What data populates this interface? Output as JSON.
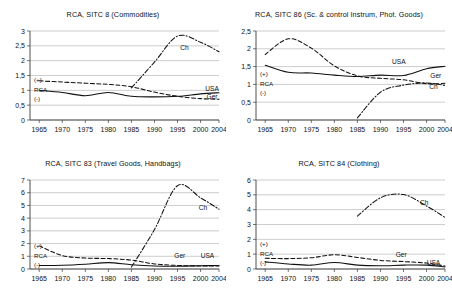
{
  "figure": {
    "panel_count": 4,
    "x_axis": {
      "label": "",
      "ticks": [
        1965,
        1970,
        1975,
        1980,
        1985,
        1990,
        1995,
        2000,
        2004
      ],
      "tick_labels": [
        "1965",
        "1970",
        "1975",
        "1980",
        "1985",
        "1990",
        "1995",
        "2000",
        "2004"
      ],
      "range": [
        1963,
        2004
      ]
    },
    "annotations": {
      "plus": "(+)",
      "rca": "RCA",
      "minus": "(-)"
    },
    "series_names": {
      "usa": "USA",
      "ger": "Ger",
      "ch": "Ch"
    },
    "colors": {
      "line": "#111111",
      "grid": "#9a9a9a",
      "axis": "#3c3c3c",
      "background": "#ffffff"
    }
  },
  "chart_data": [
    {
      "type": "line",
      "title": "RCA, SITC 8 (Commodities)",
      "xlabel": "",
      "ylabel": "",
      "xlim": [
        1963,
        2004
      ],
      "ylim": [
        0,
        3
      ],
      "yticks": [
        0,
        0.5,
        1,
        1.5,
        2,
        2.5,
        3
      ],
      "ytick_labels": [
        "0",
        "0,5",
        "1",
        "1,5",
        "2",
        "2,5",
        "3"
      ],
      "grid": true,
      "legend": "inline-labels",
      "x": [
        1965,
        1970,
        1975,
        1980,
        1985,
        1990,
        1995,
        2000,
        2004
      ],
      "series": [
        {
          "name": "USA",
          "style": "solid",
          "values": [
            1.0,
            0.93,
            0.82,
            0.93,
            0.8,
            0.78,
            0.8,
            0.88,
            0.92
          ],
          "label_xy": [
            2002.5,
            0.97
          ]
        },
        {
          "name": "Ger",
          "style": "dashed",
          "values": [
            1.32,
            1.28,
            1.24,
            1.2,
            1.12,
            0.94,
            0.8,
            0.72,
            0.7
          ],
          "label_xy": [
            2002.5,
            0.7
          ]
        },
        {
          "name": "Ch",
          "style": "dashdot",
          "values": [
            null,
            null,
            null,
            null,
            1.08,
            1.95,
            2.83,
            2.62,
            2.3
          ],
          "label_xy": [
            1996.5,
            2.37
          ]
        }
      ]
    },
    {
      "type": "line",
      "title": "RCA, SITC 86 (Sc. & control Instrum, Phot. Goods)",
      "xlabel": "",
      "ylabel": "",
      "xlim": [
        1963,
        2004
      ],
      "ylim": [
        0,
        2.5
      ],
      "yticks": [
        0,
        0.5,
        1,
        1.5,
        2,
        2.5
      ],
      "ytick_labels": [
        "0",
        "0,5",
        "1",
        "1,5",
        "2",
        "2,5"
      ],
      "grid": true,
      "legend": "inline-labels",
      "x": [
        1965,
        1970,
        1975,
        1980,
        1985,
        1990,
        1995,
        2000,
        2004
      ],
      "series": [
        {
          "name": "USA",
          "style": "solid",
          "values": [
            1.54,
            1.34,
            1.32,
            1.26,
            1.22,
            1.26,
            1.25,
            1.44,
            1.51
          ],
          "label_xy": [
            1994.0,
            1.57
          ]
        },
        {
          "name": "Ger",
          "style": "dashed",
          "values": [
            1.84,
            2.28,
            2.02,
            1.52,
            1.24,
            1.17,
            1.13,
            1.02,
            1.03
          ],
          "label_xy": [
            2002.0,
            1.18
          ]
        },
        {
          "name": "Ch",
          "style": "dashdot",
          "values": [
            null,
            null,
            null,
            null,
            0.06,
            0.78,
            0.98,
            1.04,
            0.97
          ],
          "label_xy": [
            2001.5,
            0.86
          ]
        }
      ]
    },
    {
      "type": "line",
      "title": "RCA, SITC 83 (Travel Goods, Handbags)",
      "xlabel": "",
      "ylabel": "",
      "xlim": [
        1963,
        2004
      ],
      "ylim": [
        0,
        7
      ],
      "yticks": [
        0,
        1,
        2,
        3,
        4,
        5,
        6,
        7
      ],
      "ytick_labels": [
        "0",
        "1",
        "2",
        "3",
        "4",
        "5",
        "6",
        "7"
      ],
      "grid": true,
      "legend": "inline-labels",
      "x": [
        1965,
        1970,
        1975,
        1980,
        1985,
        1990,
        1995,
        2000,
        2004
      ],
      "series": [
        {
          "name": "USA",
          "style": "solid",
          "values": [
            0.28,
            0.3,
            0.38,
            0.5,
            0.34,
            0.24,
            0.22,
            0.26,
            0.28
          ],
          "label_xy": [
            2001.5,
            0.85
          ]
        },
        {
          "name": "Ger",
          "style": "dashed",
          "values": [
            1.82,
            1.06,
            0.86,
            0.82,
            0.7,
            0.4,
            0.28,
            0.24,
            0.24
          ],
          "label_xy": [
            1995.5,
            0.84
          ]
        },
        {
          "name": "Ch",
          "style": "dashdot",
          "values": [
            null,
            null,
            null,
            null,
            0.15,
            3.1,
            6.55,
            5.6,
            4.7
          ],
          "label_xy": [
            2000.5,
            4.68
          ]
        }
      ]
    },
    {
      "type": "line",
      "title": "RCA, SITC 84 (Clothing)",
      "xlabel": "",
      "ylabel": "",
      "xlim": [
        1963,
        2004
      ],
      "ylim": [
        0,
        6
      ],
      "yticks": [
        0,
        1,
        2,
        3,
        4,
        5,
        6
      ],
      "ytick_labels": [
        "0",
        "1",
        "2",
        "3",
        "4",
        "5",
        "6"
      ],
      "grid": true,
      "legend": "inline-labels",
      "x": [
        1965,
        1970,
        1975,
        1980,
        1985,
        1990,
        1995,
        2000,
        2004
      ],
      "series": [
        {
          "name": "USA",
          "style": "solid",
          "values": [
            0.48,
            0.34,
            0.26,
            0.44,
            0.26,
            0.22,
            0.26,
            0.26,
            0.14
          ],
          "label_xy": [
            2001.5,
            0.25
          ]
        },
        {
          "name": "Ger",
          "style": "dashed",
          "values": [
            0.72,
            0.7,
            0.76,
            0.96,
            0.78,
            0.58,
            0.5,
            0.4,
            0.2
          ],
          "label_xy": [
            1994.5,
            0.84
          ]
        },
        {
          "name": "Ch",
          "style": "dashdot",
          "values": [
            null,
            null,
            null,
            null,
            3.56,
            4.8,
            5.02,
            4.25,
            3.48
          ],
          "label_xy": [
            1999.5,
            4.3
          ]
        }
      ]
    }
  ]
}
